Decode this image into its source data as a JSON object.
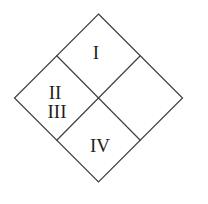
{
  "figure": {
    "labels": {
      "top": "I",
      "left_upper": "II",
      "left_lower": "III",
      "bottom": "IV",
      "right": ""
    },
    "colors": {
      "background": "#ffffff",
      "line": "#3f3f3f",
      "text": "#1f1f1f"
    }
  }
}
